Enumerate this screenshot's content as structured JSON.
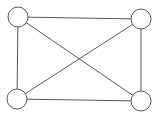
{
  "diagram": {
    "type": "graph",
    "colors": {
      "background": "#ffffff",
      "stroke": "#555555",
      "node_fill": "#ffffff"
    },
    "node_radius": 10,
    "nodes": [
      {
        "id": "top-left",
        "x": 18,
        "y": 17
      },
      {
        "id": "top-right",
        "x": 141,
        "y": 19
      },
      {
        "id": "bottom-left",
        "x": 17,
        "y": 99
      },
      {
        "id": "bottom-right",
        "x": 141,
        "y": 101
      }
    ],
    "edges": [
      {
        "from": "top-left",
        "to": "top-right"
      },
      {
        "from": "top-left",
        "to": "bottom-left"
      },
      {
        "from": "top-left",
        "to": "bottom-right"
      },
      {
        "from": "top-right",
        "to": "bottom-left"
      },
      {
        "from": "top-right",
        "to": "bottom-right"
      },
      {
        "from": "bottom-left",
        "to": "bottom-right"
      }
    ]
  }
}
